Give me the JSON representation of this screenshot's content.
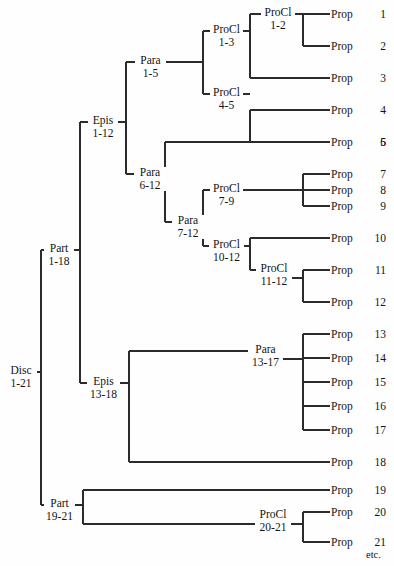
{
  "figure": {
    "type": "tree-diagram",
    "style": "bracket-cladogram",
    "line_color": "#2b2b2b",
    "background_color": "#fefefe",
    "text_color": "#141414",
    "footnote": "etc."
  },
  "root": {
    "name": "Disc",
    "range": "1-21"
  },
  "internal_nodes": [
    {
      "id": "disc",
      "name": "Disc",
      "range": "1-21"
    },
    {
      "id": "part1",
      "name": "Part",
      "range": "1-18"
    },
    {
      "id": "epis1",
      "name": "Epis",
      "range": "1-12"
    },
    {
      "id": "para1",
      "name": "Para",
      "range": "1-5"
    },
    {
      "id": "procl13",
      "name": "ProCl",
      "range": "1-3"
    },
    {
      "id": "procl12",
      "name": "ProCl",
      "range": "1-2"
    },
    {
      "id": "procl45",
      "name": "ProCl",
      "range": "4-5"
    },
    {
      "id": "para612",
      "name": "Para",
      "range": "6-12"
    },
    {
      "id": "para712",
      "name": "Para",
      "range": "7-12"
    },
    {
      "id": "procl79",
      "name": "ProCl",
      "range": "7-9"
    },
    {
      "id": "procl1012",
      "name": "ProCl",
      "range": "10-12"
    },
    {
      "id": "procl1112",
      "name": "ProCl",
      "range": "11-12"
    },
    {
      "id": "epis1318",
      "name": "Epis",
      "range": "13-18"
    },
    {
      "id": "para1317",
      "name": "Para",
      "range": "13-17"
    },
    {
      "id": "part1921",
      "name": "Part",
      "range": "19-21"
    },
    {
      "id": "procl2021",
      "name": "ProCl",
      "range": "20-21"
    }
  ],
  "leaves": [
    {
      "label": "Prop",
      "number": "1"
    },
    {
      "label": "Prop",
      "number": "2"
    },
    {
      "label": "Prop",
      "number": "3"
    },
    {
      "label": "Prop",
      "number": "4"
    },
    {
      "label": "Prop",
      "number": "5"
    },
    {
      "label": "Prop",
      "number": "6"
    },
    {
      "label": "Prop",
      "number": "7"
    },
    {
      "label": "Prop",
      "number": "8"
    },
    {
      "label": "Prop",
      "number": "9"
    },
    {
      "label": "Prop",
      "number": "10"
    },
    {
      "label": "Prop",
      "number": "11"
    },
    {
      "label": "Prop",
      "number": "12"
    },
    {
      "label": "Prop",
      "number": "13"
    },
    {
      "label": "Prop",
      "number": "14"
    },
    {
      "label": "Prop",
      "number": "15"
    },
    {
      "label": "Prop",
      "number": "16"
    },
    {
      "label": "Prop",
      "number": "17"
    },
    {
      "label": "Prop",
      "number": "18"
    },
    {
      "label": "Prop",
      "number": "19"
    },
    {
      "label": "Prop",
      "number": "20"
    },
    {
      "label": "Prop",
      "number": "21"
    }
  ],
  "hierarchy": {
    "Disc 1-21": [
      "Part 1-18",
      "Part 19-21"
    ],
    "Part 1-18": [
      "Epis 1-12",
      "Epis 13-18"
    ],
    "Epis 1-12": [
      "Para 1-5",
      "Para 6-12"
    ],
    "Para 1-5": [
      "ProCl 1-3",
      "ProCl 4-5"
    ],
    "ProCl 1-3": [
      "ProCl 1-2",
      "Prop 3"
    ],
    "ProCl 1-2": [
      "Prop 1",
      "Prop 2"
    ],
    "ProCl 4-5": [
      "Prop 4",
      "Prop 5"
    ],
    "Para 6-12": [
      "Prop 6",
      "Para 7-12"
    ],
    "Para 7-12": [
      "ProCl 7-9",
      "ProCl 10-12"
    ],
    "ProCl 7-9": [
      "Prop 7",
      "Prop 8",
      "Prop 9"
    ],
    "ProCl 10-12": [
      "Prop 10",
      "ProCl 11-12"
    ],
    "ProCl 11-12": [
      "Prop 11",
      "Prop 12"
    ],
    "Epis 13-18": [
      "Para 13-17",
      "Prop 18"
    ],
    "Para 13-17": [
      "Prop 13",
      "Prop 14",
      "Prop 15",
      "Prop 16",
      "Prop 17"
    ],
    "Part 19-21": [
      "Prop 19",
      "ProCl 20-21"
    ],
    "ProCl 20-21": [
      "Prop 20",
      "Prop 21"
    ]
  }
}
